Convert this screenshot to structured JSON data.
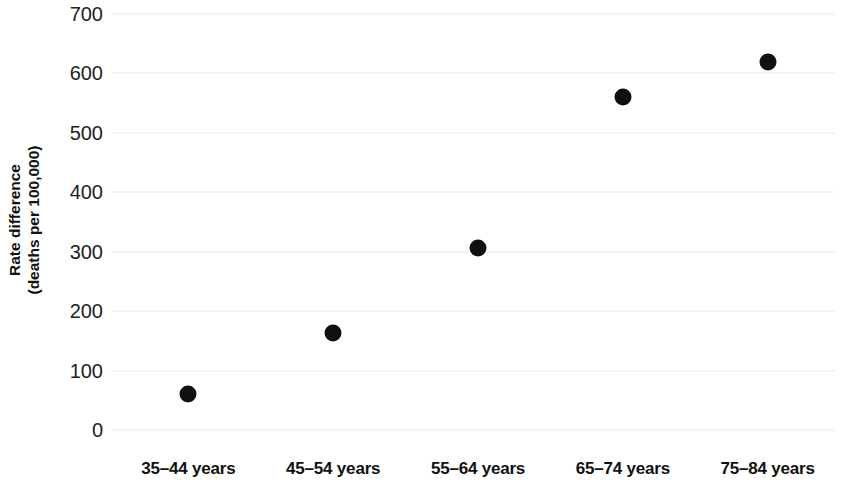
{
  "chart_data": {
    "type": "scatter",
    "title": "",
    "xlabel": "",
    "ylabel": "Rate difference (deaths per 100,000)",
    "ylabel_line1": "Rate difference",
    "ylabel_line2": "(deaths per 100,000)",
    "categories": [
      "35–44 years",
      "45–54 years",
      "55–64 years",
      "65–74 years",
      "75–84 years"
    ],
    "values": [
      61,
      163,
      306,
      561,
      620
    ],
    "ylim": [
      0,
      700
    ],
    "yticks": [
      0,
      100,
      200,
      300,
      400,
      500,
      600,
      700
    ],
    "ytick_labels": [
      "0",
      "100",
      "200",
      "300",
      "400",
      "500",
      "600",
      "700"
    ],
    "grid": true,
    "grid_axis": "y",
    "grid_color": "#e9e9e9",
    "legend": false,
    "marker": "filled-circle",
    "marker_color": "#101010",
    "marker_size_px": 17,
    "background_color": "#ffffff"
  }
}
